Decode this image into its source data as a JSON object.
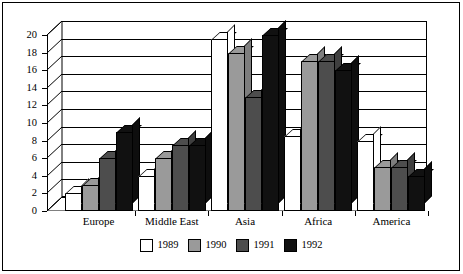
{
  "chart_data": {
    "type": "bar",
    "title": "",
    "subtitle": "",
    "xlabel": "",
    "ylabel": "",
    "categories": [
      "Europe",
      "Middle East",
      "Asia",
      "Africa",
      "America"
    ],
    "series": [
      {
        "name": "1989",
        "color": "#ffffff",
        "values": [
          2,
          4,
          19.5,
          8.5,
          8
        ]
      },
      {
        "name": "1990",
        "color": "#9a9a9a",
        "values": [
          3,
          6,
          18,
          17,
          5
        ]
      },
      {
        "name": "1991",
        "color": "#4d4d4d",
        "values": [
          6,
          7.5,
          13,
          17,
          5
        ]
      },
      {
        "name": "1992",
        "color": "#111111",
        "values": [
          9,
          7.5,
          20,
          16,
          4
        ]
      }
    ],
    "ylim": [
      0,
      20
    ],
    "ytick_step": 2,
    "ytick_labels": [
      "0",
      "2",
      "4",
      "6",
      "8",
      "10",
      "12",
      "14",
      "16",
      "18",
      "20"
    ],
    "grid": true,
    "legend_position": "bottom",
    "style": "3d-grouped-bar",
    "frame_color": "#000000",
    "background_color": "#ffffff"
  },
  "legend": {
    "items": [
      {
        "label": "1989",
        "color": "#ffffff"
      },
      {
        "label": "1990",
        "color": "#9a9a9a"
      },
      {
        "label": "1991",
        "color": "#4d4d4d"
      },
      {
        "label": "1992",
        "color": "#111111"
      }
    ]
  }
}
